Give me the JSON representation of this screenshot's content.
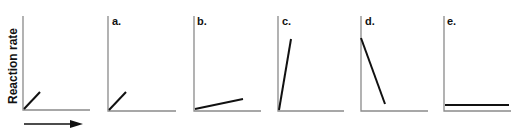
{
  "chart_data": [
    {
      "type": "line",
      "panel": "reference",
      "title": "",
      "ylabel": "Reaction rate",
      "xlabel": "",
      "x_axis_arrow": true,
      "series": [
        {
          "name": "reference",
          "points": [
            [
              0,
              0
            ],
            [
              0.25,
              0.18
            ]
          ]
        }
      ],
      "description": "Short line with moderate positive slope from origin"
    },
    {
      "type": "line",
      "panel": "a.",
      "title": "a.",
      "series": [
        {
          "name": "a",
          "points": [
            [
              0,
              0
            ],
            [
              0.25,
              0.18
            ]
          ]
        }
      ],
      "description": "Same as reference: short line with moderate positive slope"
    },
    {
      "type": "line",
      "panel": "b.",
      "title": "b.",
      "series": [
        {
          "name": "b",
          "points": [
            [
              0,
              0.02
            ],
            [
              0.72,
              0.12
            ]
          ]
        }
      ],
      "description": "Longer line with shallow positive slope"
    },
    {
      "type": "line",
      "panel": "c.",
      "title": "c.",
      "series": [
        {
          "name": "c",
          "points": [
            [
              0,
              0
            ],
            [
              0.19,
              0.76
            ]
          ]
        }
      ],
      "description": "Steep positive slope"
    },
    {
      "type": "line",
      "panel": "d.",
      "title": "d.",
      "series": [
        {
          "name": "d",
          "points": [
            [
              0,
              0.77
            ],
            [
              0.36,
              0.07
            ]
          ]
        }
      ],
      "description": "Steep negative slope from high value"
    },
    {
      "type": "line",
      "panel": "e.",
      "title": "e.",
      "series": [
        {
          "name": "e",
          "points": [
            [
              0,
              0.06
            ],
            [
              0.96,
              0.06
            ]
          ]
        }
      ],
      "description": "Flat horizontal line near zero"
    }
  ],
  "labels": {
    "ylabel": "Reaction rate",
    "panels": [
      "a.",
      "b.",
      "c.",
      "d.",
      "e."
    ]
  },
  "geometry": {
    "panels": [
      {
        "id": "ref",
        "ax": 23,
        "top": 16,
        "bottom": 110,
        "right": 90,
        "line": [
          24,
          109,
          40,
          92
        ]
      },
      {
        "id": "a",
        "ax": 108,
        "top": 16,
        "bottom": 111,
        "right": 176,
        "line": [
          109,
          110,
          126,
          92
        ],
        "label_x": 112,
        "label_y": 25
      },
      {
        "id": "b",
        "ax": 194,
        "top": 16,
        "bottom": 111,
        "right": 261,
        "line": [
          195,
          109,
          243,
          99
        ],
        "label_x": 197,
        "label_y": 25
      },
      {
        "id": "c",
        "ax": 278,
        "top": 16,
        "bottom": 111,
        "right": 344,
        "line": [
          279,
          110,
          291,
          39
        ],
        "label_x": 282,
        "label_y": 25
      },
      {
        "id": "d",
        "ax": 361,
        "top": 16,
        "bottom": 111,
        "right": 428,
        "line": [
          361,
          38,
          385,
          104
        ],
        "label_x": 365,
        "label_y": 25
      },
      {
        "id": "e",
        "ax": 444,
        "top": 16,
        "bottom": 111,
        "right": 511,
        "line": [
          445,
          105,
          509,
          105
        ],
        "label_x": 447,
        "label_y": 25
      }
    ],
    "arrow": {
      "x1": 24,
      "x2": 83,
      "y": 124
    }
  }
}
